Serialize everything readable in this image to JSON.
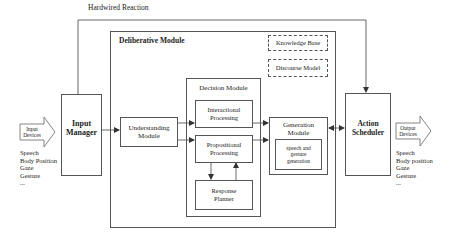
{
  "diagram": {
    "hardwired_label": "Hardwired Reaction",
    "deliberative_module": {
      "title": "Deliberative Module",
      "knowledge_base": "Knowledge Base",
      "discourse_model": "Discourse Model"
    },
    "input_devices": {
      "line1": "Input",
      "line2": "Devices",
      "items": [
        "Speech",
        "Body Position",
        "Gaze",
        "Gesture",
        "..."
      ]
    },
    "input_manager": {
      "line1": "Input",
      "line2": "Manager"
    },
    "understanding_module": {
      "line1": "Understanding",
      "line2": "Module"
    },
    "decision_module": {
      "title": "Decision Module",
      "interactional": {
        "line1": "Interactional",
        "line2": "Processing"
      },
      "propositional": {
        "line1": "Propositional",
        "line2": "Processing"
      },
      "response_planner": {
        "line1": "Response",
        "line2": "Planner"
      }
    },
    "generation_module": {
      "line1": "Generation",
      "line2": "Module",
      "inner": {
        "line1": "speech and",
        "line2": "gesture",
        "line3": "generation"
      }
    },
    "action_scheduler": {
      "line1": "Action",
      "line2": "Scheduler"
    },
    "output_devices": {
      "line1": "Output",
      "line2": "Devices",
      "items": [
        "Speech",
        "Body position",
        "Gaze",
        "Gesture",
        "..."
      ]
    },
    "colors": {
      "line": "#555555",
      "text": "#222222",
      "background": "#ffffff"
    }
  }
}
